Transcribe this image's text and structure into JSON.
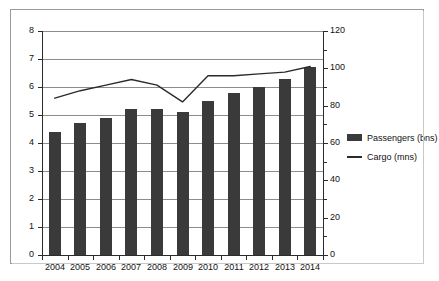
{
  "chart_data": {
    "type": "bar",
    "title": "",
    "subtitle": "",
    "xlabel": "",
    "ylabel": "",
    "y2label": "",
    "grid": true,
    "legend_position": "right",
    "categories": [
      "2004",
      "2005",
      "2006",
      "2007",
      "2008",
      "2009",
      "2010",
      "2011",
      "2012",
      "2013",
      "2014"
    ],
    "axes": {
      "left": {
        "min": 0,
        "max": 8,
        "ticks": [
          0,
          1,
          2,
          3,
          4,
          5,
          6,
          7,
          8
        ]
      },
      "right": {
        "min": 0,
        "max": 120,
        "ticks": [
          0,
          20,
          40,
          60,
          80,
          100,
          120
        ],
        "minor_step": 10
      }
    },
    "series": [
      {
        "name": "Passengers (bns)",
        "type": "bar",
        "axis": "left",
        "color": "#3a3a3a",
        "values": [
          4.4,
          4.7,
          4.9,
          5.2,
          5.2,
          5.1,
          5.5,
          5.8,
          6.0,
          6.3,
          6.7
        ]
      },
      {
        "name": "Cargo (mns)",
        "type": "line",
        "axis": "right",
        "color": "#2b2b2b",
        "values": [
          84,
          88,
          91,
          94,
          91,
          82,
          96,
          96,
          97,
          98,
          101
        ]
      }
    ]
  },
  "legend": {
    "items": [
      {
        "label": "Passengers (bns)",
        "marker": "bar-swatch"
      },
      {
        "label": "Cargo (mns)",
        "marker": "line-swatch"
      }
    ]
  }
}
